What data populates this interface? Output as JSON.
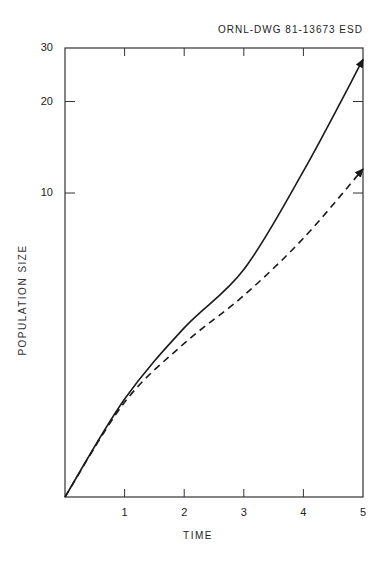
{
  "header": {
    "drawing_id": "ORNL-DWG 81-13673 ESD"
  },
  "chart_data": {
    "type": "line",
    "title": "",
    "xlabel": "TIME",
    "ylabel": "POPULATION SIZE",
    "xlim": [
      0,
      5
    ],
    "ylim": [
      1,
      30
    ],
    "yscale": "log",
    "grid": false,
    "legend": null,
    "x_ticks": [
      1,
      2,
      3,
      4,
      5
    ],
    "x_tick_labels": [
      "1",
      "2",
      "3",
      "4",
      "5"
    ],
    "y_ticks": [
      10,
      20,
      30
    ],
    "y_tick_labels": [
      "10",
      "20",
      "30"
    ],
    "x": [
      0,
      1,
      2,
      3,
      4,
      5
    ],
    "series": [
      {
        "name": "solid",
        "style": "solid",
        "arrow_end": true,
        "values": [
          1,
          2.1,
          3.6,
          5.6,
          11.8,
          27.5
        ]
      },
      {
        "name": "dashed",
        "style": "dashed",
        "arrow_end": true,
        "values": [
          1,
          2.05,
          3.2,
          4.6,
          7.1,
          12
        ]
      }
    ]
  },
  "colors": {
    "line": "#1a1a1a",
    "frame": "#333333",
    "background": "#ffffff"
  }
}
